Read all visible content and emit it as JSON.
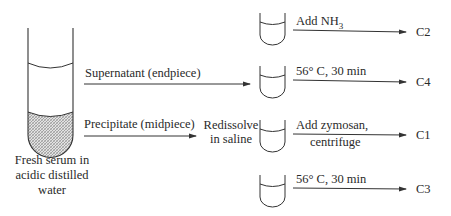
{
  "diagram": {
    "source": {
      "caption_lines": [
        "Fresh serum in",
        "acidic distilled",
        "water"
      ]
    },
    "branches": {
      "supernatant_label": "Supernatant (endpiece)",
      "precipitate_label": "Precipitate (midpiece)",
      "redissolve_lines": [
        "Redissolve",
        "in saline"
      ]
    },
    "steps": [
      {
        "treatment_lines": [
          "Add NH",
          ""
        ],
        "subscript": "3",
        "output": "C2"
      },
      {
        "treatment_lines": [
          "56° C, 30 min"
        ],
        "output": "C4"
      },
      {
        "treatment_lines": [
          "Add zymosan,",
          "centrifuge"
        ],
        "output": "C1"
      },
      {
        "treatment_lines": [
          "56° C, 30 min"
        ],
        "output": "C3"
      }
    ],
    "colors": {
      "line": "#333333",
      "precipitate_fill": "#bdbdbd"
    }
  }
}
